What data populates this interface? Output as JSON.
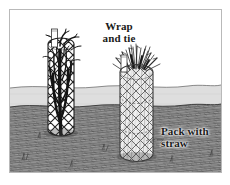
{
  "illustration": {
    "title": "Wrap and tie / Pack with straw",
    "style": "pen-and-ink line drawing",
    "labels": {
      "wrap": {
        "line1": "Wrap",
        "line2": "and tie"
      },
      "pack": {
        "line1": "Pack with",
        "line2": "straw"
      }
    },
    "colors": {
      "ink": "#1a1a1a",
      "frame_border": "#b9b9b9",
      "paper": "#ffffff",
      "sky": "#ffffff",
      "far_field": "#d9d9d9",
      "ground": "#8a8a8a",
      "ground_dark": "#5a5a5a",
      "mesh_left": "#2b2b2b",
      "mesh_right": "#6e6e6e",
      "shrub": "#141414",
      "straw": "#4a4a4a"
    },
    "scene": {
      "horizon_y": 88,
      "objects": [
        {
          "name": "wire-cage-with-shrub",
          "label_ref": "wrap",
          "contents": "bare-stem shrub",
          "fill": "dark branches",
          "x": 38,
          "y": 26,
          "width": 52,
          "height": 104
        },
        {
          "name": "wire-cage-with-straw",
          "label_ref": "pack",
          "contents": "straw",
          "fill": "light straw packing",
          "x": 110,
          "y": 52,
          "width": 62,
          "height": 110
        }
      ]
    }
  }
}
